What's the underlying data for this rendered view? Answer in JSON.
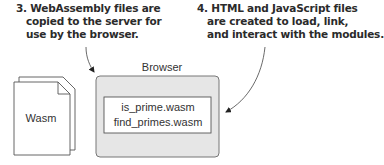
{
  "callouts": [
    {
      "lines": [
        "3. WebAssembly files are",
        "copied to the server for",
        "use by the browser."
      ]
    },
    {
      "lines": [
        "4. HTML and JavaScript files",
        "are created to load, link,",
        "and interact with the modules."
      ]
    }
  ],
  "browser": {
    "label": "Browser",
    "modules": [
      "is_prime.wasm",
      "find_primes.wasm"
    ]
  },
  "document_icon": {
    "label": "Wasm"
  },
  "colors": {
    "browser_fill": "#e6e6e6",
    "stroke": "#555555",
    "text": "#2b2b2b"
  }
}
